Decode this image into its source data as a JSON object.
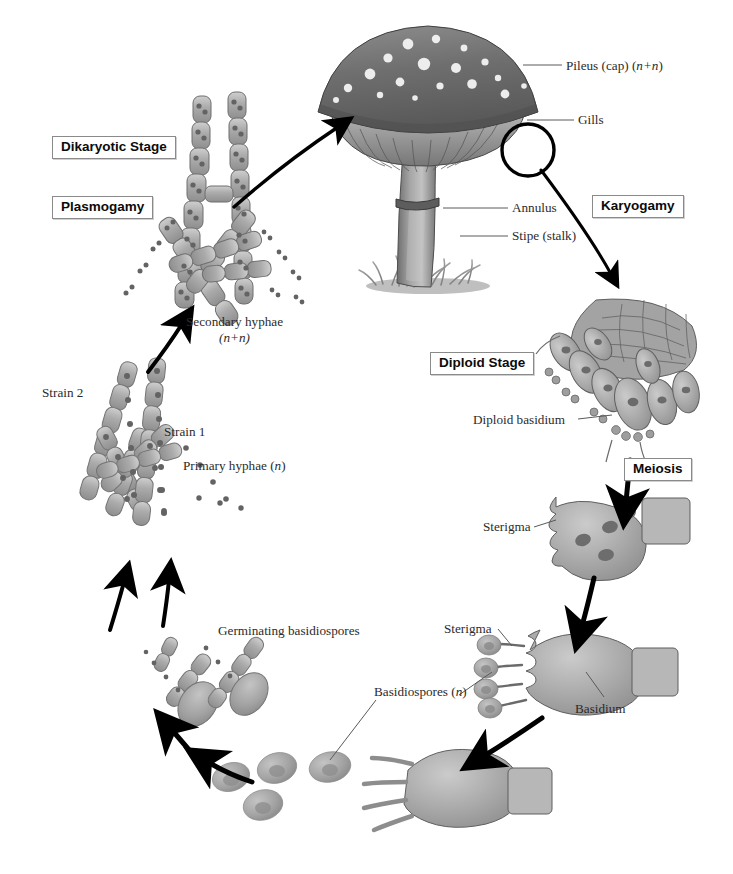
{
  "figure": {
    "domain": "biology-diagram",
    "background_color": "#ffffff",
    "ink_color": "#2b2b2b",
    "tissue_fill": "#a8a8a8",
    "nucleus_color": "#6e6e6e"
  },
  "stage_labels": [
    {
      "id": "dikaryotic",
      "text": "Dikaryotic Stage",
      "x": 52,
      "y": 136
    },
    {
      "id": "plasmogamy",
      "text": "Plasmogamy",
      "x": 52,
      "y": 196
    },
    {
      "id": "karyogamy",
      "text": "Karyogamy",
      "x": 592,
      "y": 195
    },
    {
      "id": "diploid",
      "text": "Diploid Stage",
      "x": 430,
      "y": 352
    },
    {
      "id": "meiosis",
      "text": "Meiosis",
      "x": 624,
      "y": 458
    }
  ],
  "part_labels": [
    {
      "id": "pileus",
      "text": "Pileus (cap) (",
      "italic": "n+n",
      "tail": ")",
      "x": 566,
      "y": 58,
      "align": "left"
    },
    {
      "id": "gills",
      "text": "Gills",
      "x": 578,
      "y": 115,
      "align": "left"
    },
    {
      "id": "annulus",
      "text": "Annulus",
      "x": 512,
      "y": 201,
      "align": "left"
    },
    {
      "id": "stipe",
      "text": "Stipe (stalk)",
      "x": 512,
      "y": 229,
      "align": "left"
    },
    {
      "id": "diploid-basidium",
      "text": "Diploid basidium",
      "x": 473,
      "y": 412,
      "align": "left"
    },
    {
      "id": "sterigma-meiosis",
      "text": "Sterigma",
      "x": 483,
      "y": 520,
      "align": "left"
    },
    {
      "id": "sterigma-basidium",
      "text": "Sterigma",
      "x": 444,
      "y": 622,
      "align": "left"
    },
    {
      "id": "basidiospores",
      "text": "Basidiospores (",
      "italic": "n",
      "tail": ")",
      "x": 374,
      "y": 685,
      "align": "left"
    },
    {
      "id": "basidium",
      "text": "Basidium",
      "x": 575,
      "y": 702,
      "align": "left"
    },
    {
      "id": "germinating-spores",
      "text": "Germinating basidiospores",
      "x": 218,
      "y": 624,
      "align": "left"
    },
    {
      "id": "secondary-hyphae",
      "text": "Secondary hyphae",
      "sub": "(n+n)",
      "x": 186,
      "y": 315,
      "align": "left"
    },
    {
      "id": "primary-hyphae",
      "text": "Primary hyphae (",
      "italic": "n",
      "tail": ")",
      "x": 183,
      "y": 459,
      "align": "left"
    },
    {
      "id": "strain-1",
      "text": "Strain 1",
      "x": 164,
      "y": 425,
      "align": "left"
    },
    {
      "id": "strain-2",
      "text": "Strain 2",
      "x": 42,
      "y": 386,
      "align": "left"
    }
  ],
  "cycle_steps": [
    "Germinating basidiospores",
    "Primary hyphae (n)",
    "Plasmogamy",
    "Secondary hyphae (n+n)",
    "Dikaryotic Stage",
    "Karyogamy",
    "Diploid Stage",
    "Meiosis",
    "Basidiospores (n)"
  ]
}
